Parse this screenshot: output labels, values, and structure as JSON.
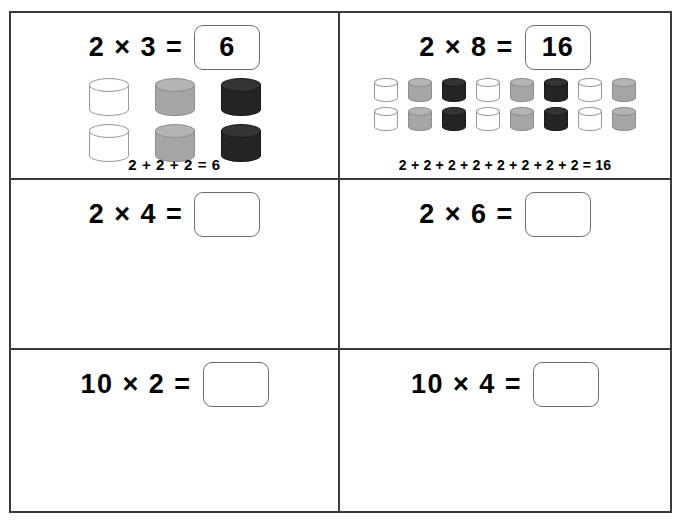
{
  "worksheet": {
    "title": "Multiplication arrays worksheet",
    "colors": {
      "grid_line": "#3b3b3f",
      "answer_box_border": "#6c6c70",
      "cylinder_white": "#ffffff",
      "cylinder_gray": "#a6a6a6",
      "cylinder_black": "#242424",
      "text": "#000000",
      "page_background": "#ffffff"
    },
    "cells": [
      {
        "id": "cell-1",
        "equation": "2 × 3 =",
        "factor_a": 2,
        "factor_b": 3,
        "answer": "6",
        "answer_filled": true,
        "addition_sentence": "2 + 2 + 2 = 6",
        "array": {
          "columns": 3,
          "rows": 2,
          "size": "big",
          "column_colors": [
            "white",
            "gray",
            "black"
          ]
        }
      },
      {
        "id": "cell-2",
        "equation": "2 × 8 =",
        "factor_a": 2,
        "factor_b": 8,
        "answer": "16",
        "answer_filled": true,
        "addition_sentence": "2 + 2 + 2 + 2 + 2 + 2 + 2 + 2 = 16",
        "array": {
          "columns": 8,
          "rows": 2,
          "size": "small",
          "column_colors": [
            "white",
            "gray",
            "black",
            "white",
            "gray",
            "black",
            "white",
            "gray"
          ]
        }
      },
      {
        "id": "cell-3",
        "equation": "2 × 4 =",
        "factor_a": 2,
        "factor_b": 4,
        "answer": "",
        "answer_filled": false,
        "addition_sentence": "",
        "array": null
      },
      {
        "id": "cell-4",
        "equation": "2 × 6 =",
        "factor_a": 2,
        "factor_b": 6,
        "answer": "",
        "answer_filled": false,
        "addition_sentence": "",
        "array": null
      },
      {
        "id": "cell-5",
        "equation": "10 × 2 =",
        "factor_a": 10,
        "factor_b": 2,
        "answer": "",
        "answer_filled": false,
        "addition_sentence": "",
        "array": null
      },
      {
        "id": "cell-6",
        "equation": "10 × 4 =",
        "factor_a": 10,
        "factor_b": 4,
        "answer": "",
        "answer_filled": false,
        "addition_sentence": "",
        "array": null
      }
    ]
  }
}
